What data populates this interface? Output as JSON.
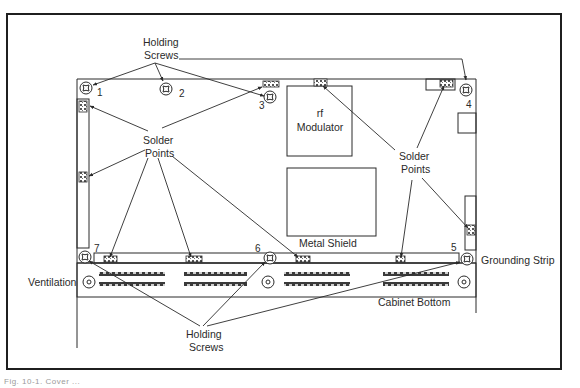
{
  "figure": {
    "caption": "Fig. 10-1. Cover ...",
    "labels": {
      "holding_screws_top_line1": "Holding",
      "holding_screws_top_line2": "Screws",
      "solder_points_left_line1": "Solder",
      "solder_points_left_line2": "Points",
      "solder_points_right_line1": "Solder",
      "solder_points_right_line2": "Points",
      "rf_modulator_line1": "rf",
      "rf_modulator_line2": "Modulator",
      "metal_shield": "Metal Shield",
      "grounding_strip": "Grounding Strip",
      "ventilation": "Ventilation",
      "cabinet_bottom": "Cabinet Bottom",
      "holding_screws_bottom_line1": "Holding",
      "holding_screws_bottom_line2": "Screws"
    },
    "screws": [
      {
        "number": "1"
      },
      {
        "number": "2"
      },
      {
        "number": "3"
      },
      {
        "number": "4"
      },
      {
        "number": "5"
      },
      {
        "number": "6"
      },
      {
        "number": "7"
      }
    ],
    "colors": {
      "line": "#2a2a2a",
      "background": "#ffffff"
    }
  }
}
